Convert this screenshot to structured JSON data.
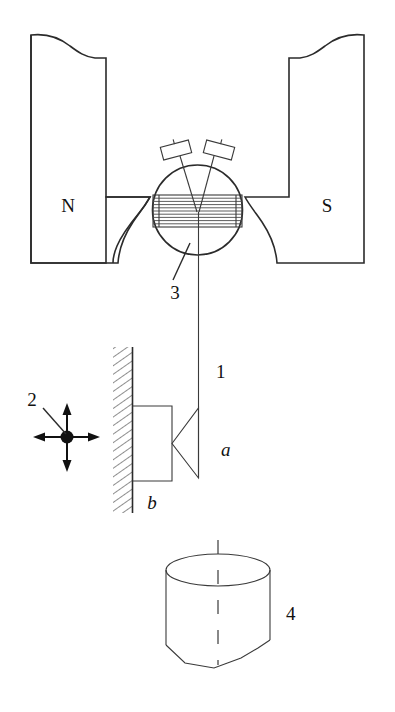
{
  "figure": {
    "type": "technical-line-diagram",
    "background_color": "#ffffff",
    "line_color": "#2b2b2b"
  },
  "labels": {
    "north_pole": "N",
    "south_pole": "S",
    "callout_1": "1",
    "callout_2": "2",
    "callout_3": "3",
    "callout_4": "4",
    "part_a": "a",
    "part_b": "b"
  },
  "parts": [
    {
      "id": "3",
      "name": "coil-rotor-assembly",
      "label": "3",
      "description": "circular core with horizontally hatched winding between the magnet pole pieces"
    },
    {
      "id": "1",
      "name": "suspension-wire",
      "label": "1",
      "description": "vertical wire hanging from the rotor down to the wedge"
    },
    {
      "id": "2",
      "name": "four-way-motion-indicator",
      "label": "2",
      "description": "filled dot with up, down, left and right arrows"
    },
    {
      "id": "4",
      "name": "cylindrical-vessel",
      "label": "4",
      "description": "cylinder with elliptical top and broken-away bottom"
    },
    {
      "id": "a",
      "name": "wedge",
      "label": "a",
      "description": "triangular wedge with apex pointing left toward the block"
    },
    {
      "id": "b",
      "name": "wall-mounted-block",
      "label": "b",
      "description": "rectangular block fixed to the hatched wall"
    }
  ],
  "magnet": {
    "north_label": "N",
    "south_label": "S",
    "description": "two magnet limbs with broken top edges and concave pole faces"
  },
  "colors": {
    "ink": "#2b2b2b",
    "ink_dark": "#111111",
    "hatch": "#3a3a3a",
    "paper": "#ffffff"
  }
}
